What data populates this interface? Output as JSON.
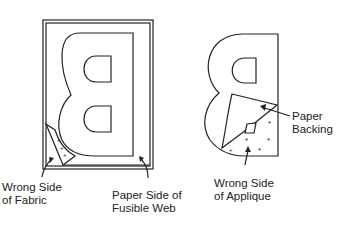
{
  "figure": {
    "left_panel": {
      "description": "Reversed letter B traced on paper side of fusible web, corner peeled back",
      "labels": {
        "wrong_side_fabric_line1": "Wrong Side",
        "wrong_side_fabric_line2": "of Fabric",
        "paper_side_line1": "Paper Side of",
        "paper_side_line2": "Fusible Web"
      }
    },
    "right_panel": {
      "description": "Cut-out reversed letter B with paper backing being peeled off",
      "labels": {
        "paper_backing_line1": "Paper",
        "paper_backing_line2": "Backing",
        "wrong_side_applique_line1": "Wrong Side",
        "wrong_side_applique_line2": "of Applique"
      }
    },
    "colors": {
      "stroke": "#222222",
      "background": "#ffffff"
    }
  }
}
